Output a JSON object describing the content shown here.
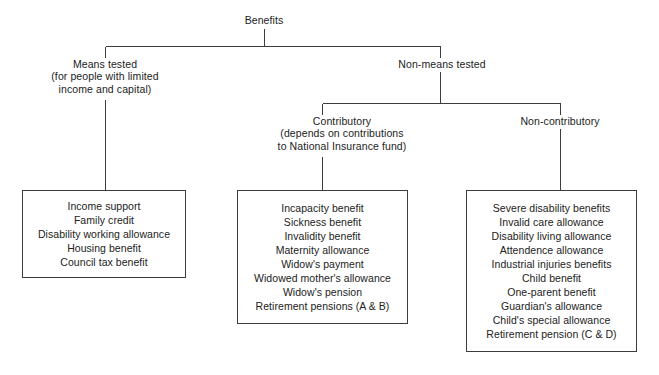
{
  "diagram": {
    "title": "Benefits",
    "type": "tree-diagram",
    "root": {
      "label": "Benefits"
    },
    "level1": [
      {
        "id": "means-tested",
        "lines": [
          "Means tested",
          "(for people with limited",
          "income and capital)"
        ]
      },
      {
        "id": "non-means-tested",
        "lines": [
          "Non-means tested"
        ]
      }
    ],
    "level2": [
      {
        "id": "contributory",
        "lines": [
          "Contributory",
          "(depends on contributions",
          "to National Insurance fund)"
        ]
      },
      {
        "id": "non-contributory",
        "lines": [
          "Non-contributory"
        ]
      }
    ],
    "boxes": [
      {
        "id": "means-tested-benefits",
        "items": [
          "Income support",
          "Family credit",
          "Disability working allowance",
          "Housing benefit",
          "Council tax benefit"
        ]
      },
      {
        "id": "contributory-benefits",
        "items": [
          "Incapacity benefit",
          "Sickness benefit",
          "Invalidity benefit",
          "Maternity allowance",
          "Widow's payment",
          "Widowed mother's allowance",
          "Widow's pension",
          "Retirement pensions (A & B)"
        ]
      },
      {
        "id": "non-contributory-benefits",
        "items": [
          "Severe disability benefits",
          "Invalid care allowance",
          "Disability living allowance",
          "Attendence allowance",
          "Industrial injuries benefits",
          "Child benefit",
          "One-parent benefit",
          "Guardian's allowance",
          "Child's special allowance",
          "Retirement pension (C & D)"
        ]
      }
    ],
    "colors": {
      "line": "#3c3c3c",
      "text": "#222222",
      "background": "#ffffff"
    }
  }
}
